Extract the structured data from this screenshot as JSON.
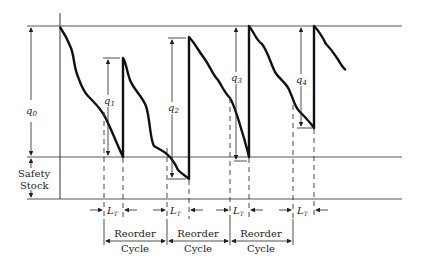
{
  "diagram": {
    "type": "inventory-sawtooth",
    "labels": {
      "q0": "q",
      "q0_sub": "0",
      "q1": "q",
      "q1_sub": "1",
      "q2": "q",
      "q2_sub": "2",
      "q3": "q",
      "q3_sub": "3",
      "q4": "q",
      "q4_sub": "4",
      "safety_line1": "Safety",
      "safety_line2": "Stock",
      "lt": "L",
      "lt_sub": "T",
      "reorder": "Reorder",
      "cycle": "Cycle"
    },
    "lead_time_count": 4,
    "reorder_cycle_count": 3
  }
}
